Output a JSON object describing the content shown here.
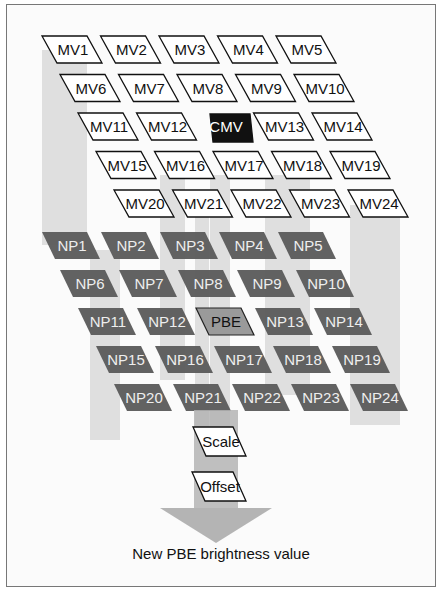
{
  "diagram": {
    "motion_vectors": {
      "rows": [
        [
          "MV1",
          "MV2",
          "MV3",
          "MV4",
          "MV5"
        ],
        [
          "MV6",
          "MV7",
          "MV8",
          "MV9",
          "MV10"
        ],
        [
          "MV11",
          "MV12",
          "CMV",
          "MV13",
          "MV14"
        ],
        [
          "MV15",
          "MV16",
          "MV17",
          "MV18",
          "MV19"
        ],
        [
          "MV20",
          "MV21",
          "MV22",
          "MV23",
          "MV24"
        ]
      ],
      "highlight": "CMV"
    },
    "neighbor_pixels": {
      "rows": [
        [
          "NP1",
          "NP2",
          "NP3",
          "NP4",
          "NP5"
        ],
        [
          "NP6",
          "NP7",
          "NP8",
          "NP9",
          "NP10"
        ],
        [
          "NP11",
          "NP12",
          "PBE",
          "NP13",
          "NP14"
        ],
        [
          "NP15",
          "NP16",
          "NP17",
          "NP18",
          "NP19"
        ],
        [
          "NP20",
          "NP21",
          "NP22",
          "NP23",
          "NP24"
        ]
      ],
      "highlight": "PBE"
    },
    "steps": [
      "Scale",
      "Offset"
    ],
    "caption": "New PBE brightness value",
    "colors": {
      "mv_fill": "#ffffff",
      "cmv_fill": "#111111",
      "np_fill": "#5a5a5a",
      "pbe_fill": "#9a9a9a",
      "band": "#c8c8c8",
      "arrow": "#b4b4b4"
    }
  }
}
